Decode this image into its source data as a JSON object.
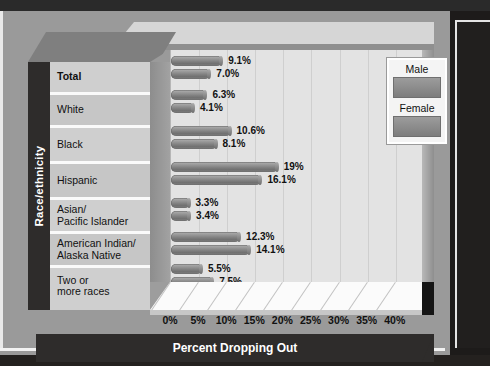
{
  "chart_data": {
    "type": "bar",
    "orientation": "horizontal",
    "title": "",
    "xlabel": "Percent Dropping Out",
    "ylabel": "Race/ethnicity",
    "xlim": [
      0,
      42
    ],
    "xticks": [
      "0%",
      "5%",
      "10%",
      "15%",
      "20%",
      "25%",
      "30%",
      "35%",
      "40%"
    ],
    "xtick_values": [
      0,
      5,
      10,
      15,
      20,
      25,
      30,
      35,
      40
    ],
    "grid": true,
    "legend_position": "top-right",
    "categories": [
      "Total",
      "White",
      "Black",
      "Hispanic",
      "Asian/\nPacific Islander",
      "American Indian/\nAlaska Native",
      "Two or\nmore races"
    ],
    "series": [
      {
        "name": "Male",
        "values": [
          9.1,
          6.3,
          10.6,
          19.0,
          3.3,
          12.3,
          5.5
        ],
        "labels": [
          "9.1%",
          "6.3%",
          "10.6%",
          "19%",
          "3.3%",
          "12.3%",
          "5.5%"
        ],
        "color": "#8d8d8d"
      },
      {
        "name": "Female",
        "values": [
          7.0,
          4.1,
          8.1,
          16.1,
          3.4,
          14.1,
          7.5
        ],
        "labels": [
          "7.0%",
          "4.1%",
          "8.1%",
          "16.1%",
          "3.4%",
          "14.1%",
          "7.5%"
        ],
        "color": "#8d8d8d"
      }
    ]
  },
  "axes": {
    "y_axis_title": "Race/ethnicity",
    "x_axis_title": "Percent Dropping Out"
  },
  "category_labels": [
    {
      "lines": [
        "Total"
      ],
      "bold": true
    },
    {
      "lines": [
        "White"
      ],
      "bold": false
    },
    {
      "lines": [
        "Black"
      ],
      "bold": false
    },
    {
      "lines": [
        "Hispanic"
      ],
      "bold": false
    },
    {
      "lines": [
        "Asian/",
        "Pacific Islander"
      ],
      "bold": false
    },
    {
      "lines": [
        "American Indian/",
        "Alaska Native"
      ],
      "bold": false
    },
    {
      "lines": [
        "Two or",
        "more races"
      ],
      "bold": false
    }
  ],
  "legend": {
    "entries": [
      {
        "label": "Male",
        "color": "#8d8d8d"
      },
      {
        "label": "Female",
        "color": "#8d8d8d"
      }
    ]
  },
  "colors": {
    "page_background": "#9a9a9a",
    "plot_background": "#e3e3e3",
    "bar_fill": "#8d8d8d",
    "axis_band": "#2e2c2b",
    "label_panel": "#cfcfcf",
    "floor": "#fbfbfb"
  }
}
